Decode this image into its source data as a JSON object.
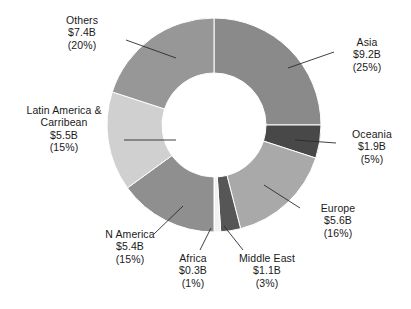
{
  "chart_data": {
    "type": "pie",
    "variant": "donut",
    "title": "",
    "subtitle": "",
    "xlabel": "",
    "ylabel": "",
    "unit": "B",
    "currency": "$",
    "legend": "none",
    "grid": false,
    "data_labels_position": "outside-with-leader-lines",
    "start_angle_deg": 0,
    "direction": "clockwise",
    "center": {
      "x": 214,
      "y": 125
    },
    "outer_radius": 107,
    "inner_radius": 52,
    "categories": [
      "Asia",
      "Oceania",
      "Europe",
      "Middle East",
      "Africa",
      "N America",
      "Latin America & Carribean",
      "Others"
    ],
    "values": [
      9.2,
      1.9,
      5.6,
      1.1,
      0.3,
      5.4,
      5.5,
      7.4
    ],
    "percentages": [
      25,
      5,
      16,
      3,
      1,
      15,
      15,
      20
    ],
    "colors": [
      "#8a8a8a",
      "#484848",
      "#a9a9a9",
      "#565656",
      "#f1f1f1",
      "#8f8f8f",
      "#d0d0d0",
      "#979797"
    ],
    "slices": [
      {
        "name": "Asia",
        "value": 9.2,
        "value_label": "$9.2B",
        "percent": 25,
        "percent_label": "(25%)",
        "color": "#8a8a8a",
        "start_deg": 0,
        "end_deg": 90
      },
      {
        "name": "Oceania",
        "value": 1.9,
        "value_label": "$1.9B",
        "percent": 5,
        "percent_label": "(5%)",
        "color": "#484848",
        "start_deg": 90,
        "end_deg": 108
      },
      {
        "name": "Europe",
        "value": 5.6,
        "value_label": "$5.6B",
        "percent": 16,
        "percent_label": "(16%)",
        "color": "#a9a9a9",
        "start_deg": 108,
        "end_deg": 165.6
      },
      {
        "name": "Middle East",
        "value": 1.1,
        "value_label": "$1.1B",
        "percent": 3,
        "percent_label": "(3%)",
        "color": "#565656",
        "start_deg": 165.6,
        "end_deg": 176.4
      },
      {
        "name": "Africa",
        "value": 0.3,
        "value_label": "$0.3B",
        "percent": 1,
        "percent_label": "(1%)",
        "color": "#f1f1f1",
        "start_deg": 176.4,
        "end_deg": 180
      },
      {
        "name": "N America",
        "value": 5.4,
        "value_label": "$5.4B",
        "percent": 15,
        "percent_label": "(15%)",
        "color": "#8f8f8f",
        "start_deg": 180,
        "end_deg": 234
      },
      {
        "name": "Latin America & Carribean",
        "value": 5.5,
        "value_label": "$5.5B",
        "percent": 15,
        "percent_label": "(15%)",
        "color": "#d0d0d0",
        "start_deg": 234,
        "end_deg": 288
      },
      {
        "name": "Others",
        "value": 7.4,
        "value_label": "$7.4B",
        "percent": 20,
        "percent_label": "(20%)",
        "color": "#979797",
        "start_deg": 288,
        "end_deg": 360
      }
    ]
  },
  "labels": {
    "asia": {
      "name": "Asia",
      "value": "$9.2B",
      "percent": "(25%)"
    },
    "oceania": {
      "name": "Oceania",
      "value": "$1.9B",
      "percent": "(5%)"
    },
    "europe": {
      "name": "Europe",
      "value": "$5.6B",
      "percent": "(16%)"
    },
    "middle_east": {
      "name": "Middle East",
      "value": "$1.1B",
      "percent": "(3%)"
    },
    "africa": {
      "name": "Africa",
      "value": "$0.3B",
      "percent": "(1%)"
    },
    "n_america": {
      "name": "N America",
      "value": "$5.4B",
      "percent": "(15%)"
    },
    "latin_america": {
      "name_line1": "Latin America &",
      "name_line2": "Carribean",
      "value": "$5.5B",
      "percent": "(15%)"
    },
    "others": {
      "name": "Others",
      "value": "$7.4B",
      "percent": "(20%)"
    }
  },
  "style": {
    "background": "#ffffff",
    "text_color": "#1a1a1a",
    "leader_line_color": "#2b2b2b",
    "hole_color": "#ffffff"
  }
}
